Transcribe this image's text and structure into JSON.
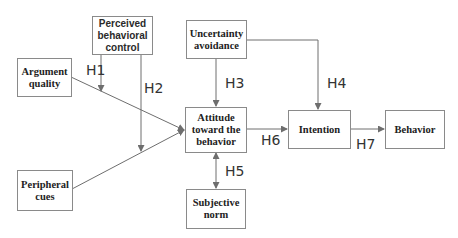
{
  "diagram": {
    "nodes": {
      "argument_quality": "Argument\nquality",
      "perceived_behavioral_control": "Perceived\nbehavioral\ncontrol",
      "uncertainty_avoidance": "Uncertainty\navoidance",
      "attitude": "Attitude\ntoward the\nbehavior",
      "intention": "Intention",
      "behavior": "Behavior",
      "peripheral_cues": "Peripheral\ncues",
      "subjective_norm": "Subjective\nnorm"
    },
    "hypotheses": {
      "h1": "H1",
      "h2": "H2",
      "h3": "H3",
      "h4": "H4",
      "h5": "H5",
      "h6": "H6",
      "h7": "H7"
    },
    "edges": [
      {
        "from": "Argument quality",
        "to": "Attitude toward the behavior"
      },
      {
        "from": "Peripheral cues",
        "to": "Attitude toward the behavior"
      },
      {
        "from": "Perceived behavioral control",
        "to": "Argument quality → Attitude",
        "label": "H1",
        "type": "moderation"
      },
      {
        "from": "Perceived behavioral control",
        "to": "Peripheral cues → Attitude",
        "label": "H2",
        "type": "moderation"
      },
      {
        "from": "Uncertainty avoidance",
        "to": "Attitude toward the behavior",
        "label": "H3"
      },
      {
        "from": "Uncertainty avoidance",
        "to": "Intention",
        "label": "H4"
      },
      {
        "from": "Attitude toward the behavior",
        "to": "Subjective norm",
        "label": "H5",
        "type": "bidirectional"
      },
      {
        "from": "Attitude toward the behavior",
        "to": "Intention",
        "label": "H6"
      },
      {
        "from": "Intention",
        "to": "Behavior",
        "label": "H7"
      }
    ],
    "colors": {
      "line": "#6e6e6e",
      "box_border": "#8a8a8a",
      "text": "#222222"
    }
  }
}
